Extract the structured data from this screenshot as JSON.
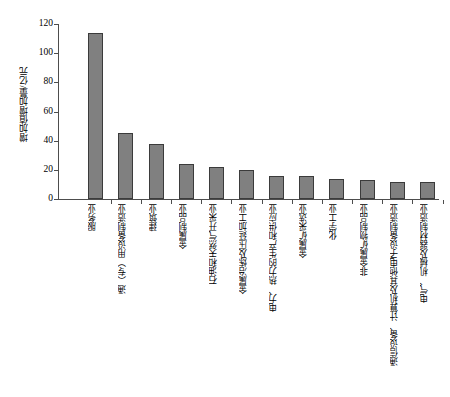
{
  "chart_data": {
    "type": "bar",
    "title": "",
    "xlabel": "",
    "ylabel": "增加值增加量/亿元",
    "ylim": [
      0,
      120
    ],
    "ytick_labels": [
      "0",
      "20",
      "40",
      "60",
      "80",
      "100",
      "120"
    ],
    "ytick_values": [
      0,
      20,
      40,
      60,
      80,
      100,
      120
    ],
    "grid": false,
    "legend": null,
    "bar_color": "#808080",
    "bar_edge_color": "#3b3b3b",
    "axis_color": "#4d4d4d",
    "categories": [
      "服务业",
      "通（专）用设备制造业",
      "建筑业",
      "金属制品业",
      "石油和天然气开采业",
      "金属冶炼及压延加工业",
      "电力、热力的生产和供应业",
      "金属矿采选业",
      "化学工业",
      "非金属矿物制品业",
      "通信设备、计算机及其他电子设备制造业",
      "电气、机械及器材制造业"
    ],
    "values": [
      114,
      45,
      38,
      24,
      22,
      20,
      16,
      16,
      13.5,
      13,
      12,
      12
    ]
  }
}
